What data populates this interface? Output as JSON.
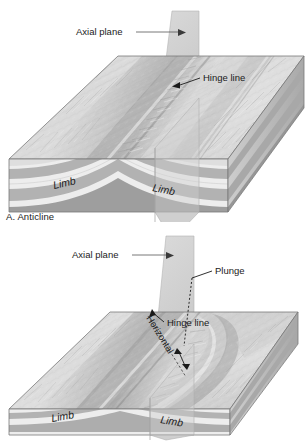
{
  "figure": {
    "background": "#ffffff"
  },
  "panel_a": {
    "caption": "A. Anticline",
    "labels": {
      "axial_plane": "Axial plane",
      "hinge_line": "Hinge line",
      "limb_left": "Limb",
      "limb_right": "Limb"
    }
  },
  "panel_b": {
    "caption": "B. Plunging anticline",
    "labels": {
      "axial_plane": "Axial plane",
      "hinge_line": "Hinge line",
      "horizontal": "Horizontal",
      "plunge": "Plunge",
      "limb_left": "Limb",
      "limb_right": "Limb"
    }
  },
  "colors": {
    "band_light": "#ededed",
    "band_medium": "#b2b2b2",
    "band_dark": "#9a9a9a",
    "terrain_light": "#e3e3e3",
    "terrain_mid": "#c0c0c0",
    "terrain_dark": "#8e8e8e",
    "axial_plane": "#c9c9c9",
    "outline": "#6e6e6e",
    "text": "#1a1a1a",
    "leader": "#555555"
  }
}
